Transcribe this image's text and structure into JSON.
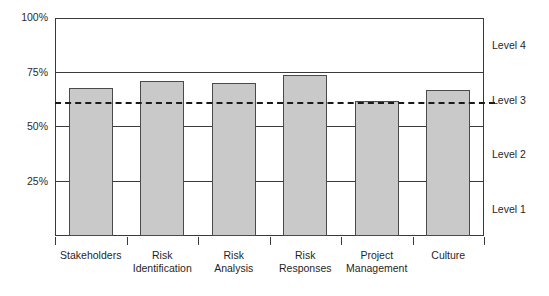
{
  "chart_data": {
    "type": "bar",
    "title": "",
    "subtitle": "",
    "xlabel": "",
    "ylabel": "",
    "categories": [
      "Stakeholders",
      "Risk Identification",
      "Risk Analysis",
      "Risk Responses",
      "Project Management",
      "Culture"
    ],
    "category_lines": [
      [
        "Stakeholders"
      ],
      [
        "Risk",
        "Identification"
      ],
      [
        "Risk",
        "Analysis"
      ],
      [
        "Risk",
        "Responses"
      ],
      [
        "Project",
        "Management"
      ],
      [
        "Culture"
      ]
    ],
    "values": [
      68,
      71,
      70,
      74,
      62,
      67
    ],
    "ylim": [
      0,
      100
    ],
    "yticks": [
      0,
      25,
      50,
      75,
      100
    ],
    "ytick_labels": [
      "",
      "25%",
      "50%",
      "75%",
      "100%"
    ],
    "gridlines": [
      25,
      50,
      75
    ],
    "grid": true,
    "legend_position": "none",
    "threshold": {
      "value": 61,
      "style": "dashed",
      "label": ""
    },
    "bands": [
      {
        "label": "Level 1",
        "from": 0,
        "to": 25,
        "center": 12.5
      },
      {
        "label": "Level 2",
        "from": 25,
        "to": 50,
        "center": 37.5
      },
      {
        "label": "Level 3",
        "from": 50,
        "to": 75,
        "center": 62.5
      },
      {
        "label": "Level 4",
        "from": 75,
        "to": 100,
        "center": 87.5
      }
    ],
    "colors": {
      "bar_fill": "#c9c9c9",
      "bar_stroke": "#4a4a4a",
      "axis": "#3a3a3a",
      "threshold": "#1a1a1a",
      "background": "#ffffff",
      "text": "#1f1f1f"
    }
  }
}
